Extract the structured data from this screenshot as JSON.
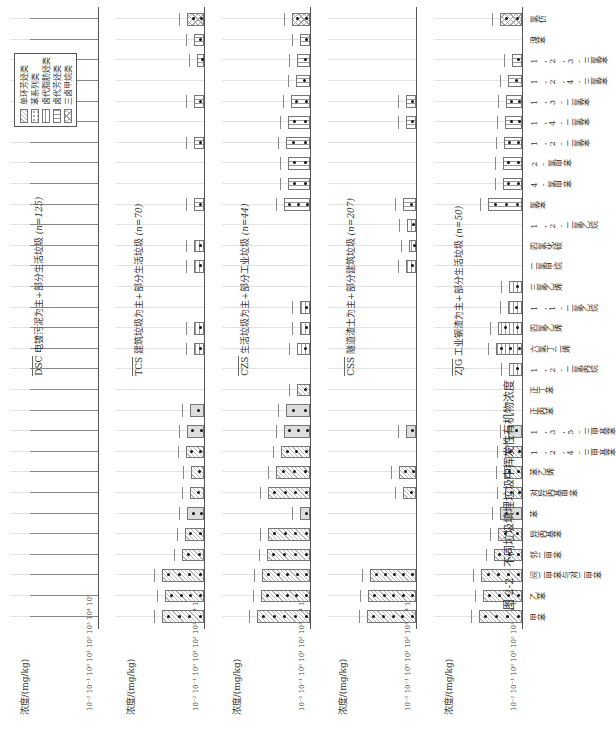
{
  "caption": {
    "figure_no": "图 2-2",
    "title": "不同垃圾填埋垃圾中挥发性有机物浓度"
  },
  "y_axis": {
    "label": "浓度/(mg/kg)",
    "ticks": [
      "10⁻²",
      "10⁻¹",
      "10⁰",
      "10¹",
      "10²",
      "10³",
      "10⁴",
      "10⁵"
    ]
  },
  "legend": {
    "items": [
      {
        "label": "单环芳烃类",
        "pattern": "diag"
      },
      {
        "label": "苯系列类",
        "pattern": "dots"
      },
      {
        "label": "卤代脂肪烃类",
        "pattern": "h"
      },
      {
        "label": "卤代芳烃类",
        "pattern": "v"
      },
      {
        "label": "三卤甲烷类",
        "pattern": "x"
      }
    ]
  },
  "categories": [
    "甲苯",
    "乙苯",
    "间二甲苯与对二甲苯",
    "邻二甲苯",
    "异丙基苯",
    "苯",
    "对异丙基甲苯",
    "苯乙烯",
    "1,2,4-三甲基苯",
    "1,3,5-三甲基苯",
    "正丙苯",
    "正丁苯",
    "1,2-二氯丙烷",
    "六氯丁二烯",
    "四氯乙烯",
    "1,1-二氯乙烷",
    "三氯乙烯",
    "二氯甲烷",
    "四氯化碳",
    "1,2-二氯乙烷",
    "氯苯",
    "4-氯甲苯",
    "2-氯甲苯",
    "1,2-二氯苯",
    "1,4-二氯苯",
    "1,3-二氯苯",
    "1,2,4-三氯苯",
    "1,2,3-三氯苯",
    "溴苯",
    "氯仿"
  ],
  "panels": [
    {
      "code": "DSC",
      "desc": "电镀污泥为主+部分生活垃圾",
      "n": "(n=125)"
    },
    {
      "code": "TCS",
      "desc": "建筑垃圾为主+部分生活垃圾",
      "n": "(n=70)"
    },
    {
      "code": "CZS",
      "desc": "生活垃圾为主+部分工业垃圾",
      "n": "(n=44)"
    },
    {
      "code": "CSS",
      "desc": "隧道渣土为主+部分建筑垃圾",
      "n": "(n=207)"
    },
    {
      "code": "ZJG",
      "desc": "工业钢渣为主+部分生活垃圾",
      "n": "(n=50)"
    }
  ],
  "chart_data": {
    "type": "bar",
    "title": "不同垃圾填埋垃圾中挥发性有机物浓度",
    "xlabel": "",
    "ylabel": "浓度/(mg/kg)",
    "yscale": "log",
    "ylim": [
      0.01,
      100000
    ],
    "categories": [
      "甲苯",
      "乙苯",
      "间二甲苯与对二甲苯",
      "邻二甲苯",
      "异丙基苯",
      "苯",
      "对异丙基甲苯",
      "苯乙烯",
      "1,2,4-三甲基苯",
      "1,3,5-三甲基苯",
      "正丙苯",
      "正丁苯",
      "1,2-二氯丙烷",
      "六氯丁二烯",
      "四氯乙烯",
      "1,1-二氯乙烷",
      "三氯乙烯",
      "二氯甲烷",
      "四氯化碳",
      "1,2-二氯乙烷",
      "氯苯",
      "4-氯甲苯",
      "2-氯甲苯",
      "1,2-二氯苯",
      "1,4-二氯苯",
      "1,3-二氯苯",
      "1,2,4-三氯苯",
      "1,2,3-三氯苯",
      "溴苯",
      "氯仿"
    ],
    "series": [
      {
        "name": "ZJG (n=50)",
        "values": [
          300,
          100,
          150,
          8,
          3,
          2,
          0.5,
          0.8,
          0.6,
          0.3,
          null,
          null,
          0.2,
          5,
          3,
          0.3,
          0.2,
          null,
          null,
          null,
          30,
          1,
          1,
          0.8,
          0.5,
          0.4,
          0.3,
          0.1,
          null,
          2
        ]
      },
      {
        "name": "CSS (n=207)",
        "values": [
          1000,
          800,
          500,
          null,
          null,
          null,
          0.2,
          0.5,
          null,
          0.1,
          null,
          null,
          null,
          null,
          null,
          null,
          null,
          0.1,
          0.05,
          0.08,
          0.2,
          null,
          null,
          null,
          0.1,
          0.1,
          null,
          null,
          null,
          null
        ]
      },
      {
        "name": "CZS (n=44)",
        "values": [
          3000,
          1000,
          800,
          300,
          200,
          0.1,
          200,
          30,
          10,
          5,
          3,
          0.2,
          null,
          0.2,
          0.1,
          0.1,
          null,
          null,
          null,
          null,
          5,
          2,
          2,
          3,
          2,
          1,
          0.3,
          0.2,
          0.1,
          0.8
        ]
      },
      {
        "name": "TCS (n=70)",
        "values": [
          200,
          100,
          200,
          2,
          1,
          0.5,
          0.3,
          0.2,
          0.8,
          0.6,
          0.3,
          null,
          null,
          0.1,
          0.1,
          null,
          null,
          0.1,
          0.1,
          null,
          0.1,
          null,
          null,
          0.1,
          null,
          0.1,
          null,
          0.05,
          0.1,
          0.5
        ]
      },
      {
        "name": "DSC (n=125)",
        "values": [
          null,
          null,
          null,
          null,
          null,
          null,
          null,
          null,
          null,
          null,
          null,
          null,
          null,
          null,
          null,
          null,
          null,
          null,
          null,
          null,
          null,
          null,
          null,
          null,
          null,
          null,
          null,
          null,
          null,
          null
        ]
      }
    ],
    "legend": [
      "单环芳烃类",
      "苯系列类",
      "卤代脂肪烃类",
      "卤代芳烃类",
      "三卤甲烷类"
    ],
    "grid": true
  }
}
